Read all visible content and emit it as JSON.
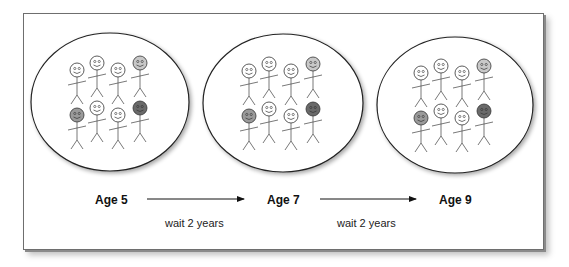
{
  "figure": {
    "groups": [
      {
        "label": "Age 5",
        "people": [
          {
            "row": 1,
            "col": 1,
            "head": "white"
          },
          {
            "row": 1,
            "col": 2,
            "head": "white"
          },
          {
            "row": 1,
            "col": 3,
            "head": "white"
          },
          {
            "row": 1,
            "col": 4,
            "head": "light-gray"
          },
          {
            "row": 2,
            "col": 1,
            "head": "medium-gray"
          },
          {
            "row": 2,
            "col": 2,
            "head": "white"
          },
          {
            "row": 2,
            "col": 3,
            "head": "white"
          },
          {
            "row": 2,
            "col": 4,
            "head": "dark-gray"
          }
        ]
      },
      {
        "label": "Age 7",
        "people": [
          {
            "row": 1,
            "col": 1,
            "head": "white"
          },
          {
            "row": 1,
            "col": 2,
            "head": "white"
          },
          {
            "row": 1,
            "col": 3,
            "head": "white"
          },
          {
            "row": 1,
            "col": 4,
            "head": "light-gray"
          },
          {
            "row": 2,
            "col": 1,
            "head": "medium-gray"
          },
          {
            "row": 2,
            "col": 2,
            "head": "white"
          },
          {
            "row": 2,
            "col": 3,
            "head": "white"
          },
          {
            "row": 2,
            "col": 4,
            "head": "dark-gray"
          }
        ]
      },
      {
        "label": "Age 9",
        "people": [
          {
            "row": 1,
            "col": 1,
            "head": "white"
          },
          {
            "row": 1,
            "col": 2,
            "head": "white"
          },
          {
            "row": 1,
            "col": 3,
            "head": "white"
          },
          {
            "row": 1,
            "col": 4,
            "head": "light-gray"
          },
          {
            "row": 2,
            "col": 1,
            "head": "medium-gray"
          },
          {
            "row": 2,
            "col": 2,
            "head": "white"
          },
          {
            "row": 2,
            "col": 3,
            "head": "white"
          },
          {
            "row": 2,
            "col": 4,
            "head": "dark-gray"
          }
        ]
      }
    ],
    "transitions": [
      {
        "from": "Age 5",
        "to": "Age 7",
        "label": "wait 2 years"
      },
      {
        "from": "Age 7",
        "to": "Age 9",
        "label": "wait 2 years"
      }
    ],
    "colors": {
      "white": "#ffffff",
      "light-gray": "#c8c8c8",
      "medium-gray": "#9a9a9a",
      "dark-gray": "#6a6a6a",
      "stroke": "#333333"
    }
  }
}
